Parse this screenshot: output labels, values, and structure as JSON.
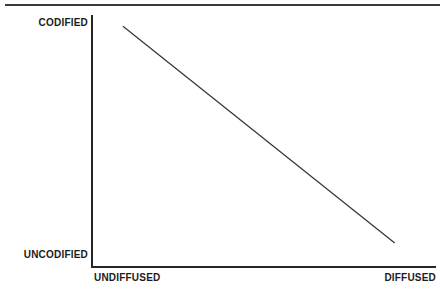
{
  "figure": {
    "background_color": "#ffffff",
    "rule_color": "#3a3a3a",
    "axis_color": "#262626",
    "line_color": "#333333",
    "text_color": "#1c1c1c"
  },
  "axes": {
    "y_top_label": "CODIFIED",
    "y_bottom_label": "UNCODIFIED",
    "x_left_label": "UNDIFFUSED",
    "x_right_label": "DIFFUSED"
  },
  "chart_data": {
    "type": "line",
    "title": "",
    "subtitle": "",
    "xlabel": "",
    "ylabel": "",
    "grid": false,
    "legend": null,
    "x": [
      0.09,
      0.88
    ],
    "y": [
      0.955,
      0.095
    ],
    "xlim": [
      0,
      1
    ],
    "ylim": [
      0,
      1
    ],
    "x_tick_labels": [
      "UNDIFFUSED",
      "DIFFUSED"
    ],
    "y_tick_labels": [
      "UNCODIFIED",
      "CODIFIED"
    ],
    "series": [
      {
        "name": "codification-diffusion curve",
        "x": [
          0.09,
          0.88
        ],
        "y": [
          0.955,
          0.095
        ]
      }
    ],
    "annotations": []
  }
}
